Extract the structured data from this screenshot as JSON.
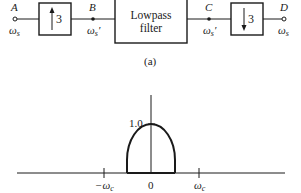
{
  "block_diagram": {
    "caption": "(a)",
    "nodes": [
      {
        "id": "A",
        "label": "A",
        "freq_label": "ω",
        "freq_sub": "s",
        "freq_prime": "",
        "marker": "open-circle"
      },
      {
        "id": "B",
        "label": "B",
        "freq_label": "ω",
        "freq_sub": "s",
        "freq_prime": "′",
        "marker": "filled-dot"
      },
      {
        "id": "C",
        "label": "C",
        "freq_label": "ω",
        "freq_sub": "s",
        "freq_prime": "′",
        "marker": "filled-dot"
      },
      {
        "id": "D",
        "label": "D",
        "freq_label": "ω",
        "freq_sub": "s",
        "freq_prime": "",
        "marker": "open-circle"
      }
    ],
    "blocks": [
      {
        "id": "upsampler",
        "factor": "3",
        "arrow": "up"
      },
      {
        "id": "lowpass",
        "line1": "Lowpass",
        "line2": "filter"
      },
      {
        "id": "downsampler",
        "factor": "3",
        "arrow": "down"
      }
    ]
  },
  "spectrum_plot": {
    "peak_label": "1.0",
    "x_ticks": [
      {
        "label_prefix": "−",
        "label": "ω",
        "sub": "c"
      },
      {
        "label_prefix": "",
        "label": "0",
        "sub": ""
      },
      {
        "label_prefix": "",
        "label": "ω",
        "sub": "c"
      }
    ]
  }
}
